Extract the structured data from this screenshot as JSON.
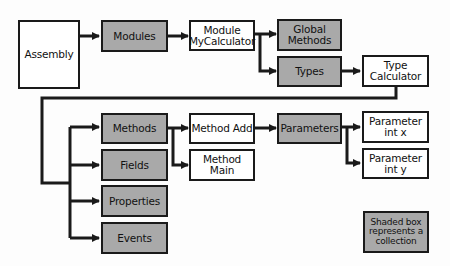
{
  "diagram": {
    "nodes": {
      "assembly": {
        "label": "Assembly",
        "shaded": false
      },
      "modules": {
        "label": "Modules",
        "shaded": true
      },
      "module_mycalculator": {
        "label": "Module\nMyCalculator",
        "shaded": false
      },
      "global_methods": {
        "label": "Global\nMethods",
        "shaded": true
      },
      "types": {
        "label": "Types",
        "shaded": true
      },
      "type_calculator": {
        "label": "Type\nCalculator",
        "shaded": false
      },
      "methods": {
        "label": "Methods",
        "shaded": true
      },
      "fields": {
        "label": "Fields",
        "shaded": true
      },
      "properties": {
        "label": "Properties",
        "shaded": true
      },
      "events": {
        "label": "Events",
        "shaded": true
      },
      "method_add": {
        "label": "Method Add",
        "shaded": false
      },
      "method_main": {
        "label": "Method\nMain",
        "shaded": false
      },
      "parameters": {
        "label": "Parameters",
        "shaded": true
      },
      "parameter_int_x": {
        "label": "Parameter\nint x",
        "shaded": false
      },
      "parameter_int_y": {
        "label": "Parameter\nint y",
        "shaded": false
      }
    },
    "edges": [
      [
        "Assembly",
        "Modules"
      ],
      [
        "Modules",
        "Module MyCalculator"
      ],
      [
        "Module MyCalculator",
        "Global Methods"
      ],
      [
        "Module MyCalculator",
        "Types"
      ],
      [
        "Types",
        "Type Calculator"
      ],
      [
        "Type Calculator",
        "Methods"
      ],
      [
        "Type Calculator",
        "Fields"
      ],
      [
        "Type Calculator",
        "Properties"
      ],
      [
        "Type Calculator",
        "Events"
      ],
      [
        "Methods",
        "Method Add"
      ],
      [
        "Methods",
        "Method Main"
      ],
      [
        "Method Add",
        "Parameters"
      ],
      [
        "Parameters",
        "Parameter int x"
      ],
      [
        "Parameters",
        "Parameter int y"
      ]
    ],
    "legend": {
      "label": "Shaded box\nrepresents a\ncollection",
      "shaded": true
    },
    "colors": {
      "shaded_fill": "#a9a9a9",
      "plain_fill": "#ffffff",
      "stroke": "#1a1a1a"
    }
  }
}
